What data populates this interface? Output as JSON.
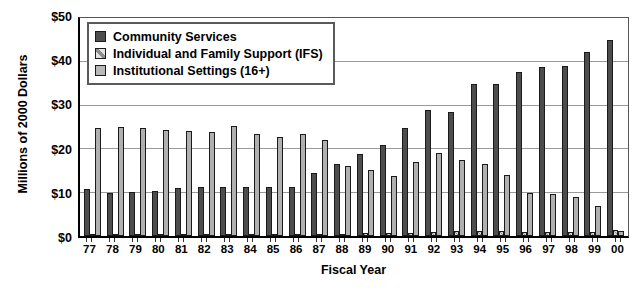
{
  "chart_data": {
    "type": "bar",
    "title": "",
    "xlabel": "Fiscal Year",
    "ylabel": "Millions of 2000 Dollars",
    "ylim": [
      0,
      50
    ],
    "yticks": [
      0,
      10,
      20,
      30,
      40,
      50
    ],
    "ytick_labels": [
      "$0",
      "$10",
      "$20",
      "$30",
      "$40",
      "$50"
    ],
    "grid": true,
    "legend_position": "top-left",
    "categories": [
      "77",
      "78",
      "79",
      "80",
      "81",
      "82",
      "83",
      "84",
      "85",
      "86",
      "87",
      "88",
      "89",
      "90",
      "91",
      "92",
      "93",
      "94",
      "95",
      "96",
      "97",
      "98",
      "99",
      "00"
    ],
    "series": [
      {
        "name": "Community Services",
        "color": "#4d4d4d",
        "values": [
          10.8,
          10.0,
          10.2,
          10.3,
          11.0,
          11.3,
          11.4,
          11.3,
          11.3,
          11.3,
          14.5,
          16.5,
          19.0,
          21.0,
          25.0,
          29.0,
          28.5,
          35.0,
          35.0,
          37.8,
          39.0,
          39.2,
          42.5,
          45.2
        ]
      },
      {
        "name": "Individual and Family Support (IFS)",
        "color": "#d8d8d8",
        "values": [
          0.3,
          0.3,
          0.3,
          0.3,
          0.3,
          0.3,
          0.3,
          0.3,
          0.3,
          0.3,
          0.4,
          0.5,
          0.6,
          0.7,
          0.8,
          0.9,
          1.1,
          1.2,
          1.1,
          1.0,
          0.9,
          0.9,
          1.0,
          1.3
        ]
      },
      {
        "name": "Institutional Settings (16+)",
        "color": "#b0b0b0",
        "values": [
          25.0,
          25.1,
          25.0,
          24.4,
          24.2,
          23.9,
          25.4,
          23.5,
          22.9,
          23.6,
          22.1,
          16.2,
          15.2,
          13.9,
          17.0,
          19.2,
          17.5,
          16.5,
          14.0,
          10.0,
          9.6,
          9.0,
          7.0,
          1.1
        ]
      }
    ]
  },
  "legend": {
    "items": [
      {
        "label": "Community Services",
        "pattern": "solid-dark"
      },
      {
        "label": "Individual and Family Support (IFS)",
        "pattern": "diagonal-hatch-light"
      },
      {
        "label": "Institutional Settings (16+)",
        "pattern": "solid-gray"
      }
    ]
  }
}
